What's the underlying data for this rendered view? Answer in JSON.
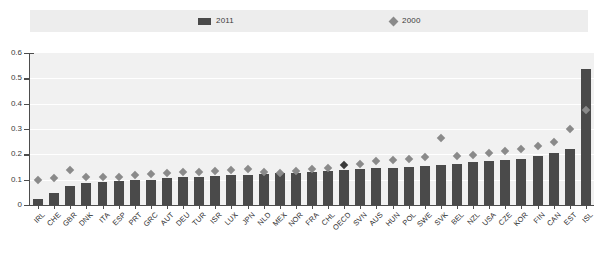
{
  "legend": {
    "items": [
      {
        "label": "2011",
        "marker": "square-marker",
        "color": "#4a4a4a"
      },
      {
        "label": "2000",
        "marker": "diamond-marker",
        "color": "#8a8a8a"
      }
    ]
  },
  "axis": {
    "y_ticks": [
      "0.6",
      "0.5",
      "0.4",
      "0.3",
      "0.2",
      "0.1",
      "0"
    ]
  },
  "chart_data": {
    "type": "bar",
    "title": "",
    "subtitle": "",
    "xlabel": "",
    "ylabel": "",
    "ylim": [
      0,
      0.6
    ],
    "ytick_step": 0.1,
    "grid": true,
    "legend_position": "top",
    "highlight_category": "OECD",
    "bar_color": "#4a4a4a",
    "marker_color": "#8a8a8a",
    "highlight_marker_color": "#3a3a3a",
    "categories": [
      "IRL",
      "CHE",
      "GBR",
      "DNK",
      "ITA",
      "ESP",
      "PRT",
      "GRC",
      "AUT",
      "DEU",
      "TUR",
      "ISR",
      "LUX",
      "JPN",
      "NLD",
      "MEX",
      "NOR",
      "FRA",
      "CHL",
      "OECD",
      "SVN",
      "AUS",
      "HUN",
      "POL",
      "SWE",
      "SVK",
      "BEL",
      "NZL",
      "USA",
      "CZE",
      "KOR",
      "FIN",
      "CAN",
      "EST",
      "ISL"
    ],
    "series": [
      {
        "name": "2011",
        "type": "bar",
        "values": [
          0.025,
          0.048,
          0.075,
          0.088,
          0.092,
          0.095,
          0.098,
          0.1,
          0.105,
          0.11,
          0.112,
          0.115,
          0.118,
          0.12,
          0.122,
          0.125,
          0.128,
          0.13,
          0.135,
          0.14,
          0.142,
          0.145,
          0.148,
          0.152,
          0.155,
          0.158,
          0.162,
          0.168,
          0.172,
          0.178,
          0.182,
          0.195,
          0.205,
          0.222,
          0.537
        ]
      },
      {
        "name": "2000",
        "type": "scatter",
        "values": [
          0.098,
          0.105,
          0.138,
          0.112,
          0.11,
          0.112,
          0.118,
          0.122,
          0.128,
          0.13,
          0.132,
          0.135,
          0.138,
          0.142,
          0.132,
          0.128,
          0.135,
          0.142,
          0.148,
          0.158,
          0.162,
          0.172,
          0.178,
          0.182,
          0.188,
          0.265,
          0.192,
          0.198,
          0.205,
          0.215,
          0.222,
          0.232,
          0.248,
          0.302,
          0.375
        ]
      }
    ]
  }
}
